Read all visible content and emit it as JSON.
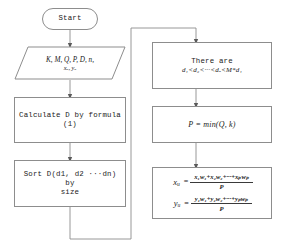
{
  "diagram": {
    "type": "flowchart",
    "orientation": "two-column, left-to-right",
    "stroke_color": "#8d8d8d",
    "text_color": "#1a1a1a",
    "background_color": "#ffffff"
  },
  "nodes": {
    "start": {
      "id": "start",
      "shape": "terminator",
      "label": "Start"
    },
    "inputs": {
      "id": "inputs",
      "shape": "parallelogram",
      "label_line1": "K, M, Q, P, D, n,",
      "label_line2": "xᵤ, yᵤ",
      "label_plain": "K, M, Q, P, D, n, xu, yu"
    },
    "calculate_d": {
      "id": "calculate-d",
      "shape": "process",
      "label_line1": "Calculate D by formula",
      "label_line2": "(1)",
      "label_plain": "Calculate D by formula (1)"
    },
    "sort_d": {
      "id": "sort-d",
      "shape": "process",
      "label_line1": "Sort D(d1, d2 ···dn) by",
      "label_line2": "size",
      "label_plain": "Sort D(d1, d2 ···dn) by size"
    },
    "there_are": {
      "id": "there-are",
      "shape": "process",
      "label_line1": "There are",
      "label_line2": "d₁<d₂<···<dₒ<M*d₁",
      "label_plain": "There are d1<d2<...<dq<M*d1"
    },
    "p_min": {
      "id": "p-min",
      "shape": "process",
      "label": "P = min(Q, k)"
    },
    "centroid": {
      "id": "centroid",
      "shape": "process",
      "label_plain": "xu = (x1w1+x2w2+...+xpwp)/P ; yu = (y1w1+y2w2+...+ypwp)/P",
      "row1": {
        "lhs": "x",
        "lhs_sub": "u",
        "eq": "=",
        "numerator": "x₁w₁+x₂w₂+···+xₚwₚ",
        "denominator": "P"
      },
      "row2": {
        "lhs": "y",
        "lhs_sub": "u",
        "eq": "=",
        "numerator": "y₁w₁+y₂w₂+···+yₚwₚ",
        "denominator": "P"
      }
    }
  },
  "edges": [
    {
      "id": "e1",
      "from": "start",
      "to": "inputs",
      "style": "straight-down",
      "arrow": true
    },
    {
      "id": "e2",
      "from": "inputs",
      "to": "calculate-d",
      "style": "straight-down",
      "arrow": true
    },
    {
      "id": "e3",
      "from": "calculate-d",
      "to": "sort-d",
      "style": "straight-down",
      "arrow": true
    },
    {
      "id": "e4",
      "from": "sort-d",
      "to": "there-are",
      "style": "orthogonal-down-right-up",
      "arrow": true
    },
    {
      "id": "e5",
      "from": "there-are",
      "to": "p-min",
      "style": "straight-down",
      "arrow": true
    },
    {
      "id": "e6",
      "from": "p-min",
      "to": "centroid",
      "style": "straight-down",
      "arrow": true
    }
  ]
}
